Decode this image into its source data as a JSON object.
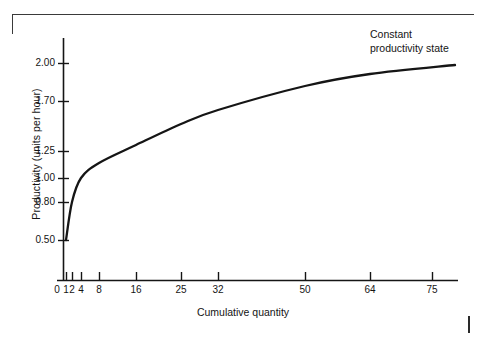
{
  "figure": {
    "annotation": "Constant\nproductivity state",
    "annotation_x": 370,
    "annotation_y": 28
  },
  "chart_data": {
    "type": "line",
    "title": "",
    "subtitle": "",
    "xlabel": "Cumulative quantity",
    "ylabel": "Productivity (units per hour)",
    "grid": false,
    "legend": null,
    "annotations": [
      {
        "text": "Constant productivity state",
        "x": 75,
        "y": 2.0,
        "position": "top-right"
      }
    ],
    "x_axis": {
      "label": "Cumulative quantity",
      "scale": "compressed-nonlinear",
      "tick_values": [
        0,
        1,
        2,
        4,
        8,
        16,
        25,
        32,
        50,
        64,
        75
      ],
      "tick_labels": [
        "0",
        "1",
        "2",
        "4",
        "8",
        "16",
        "25",
        "32",
        "50",
        "64",
        "75"
      ],
      "tick_px": [
        57,
        66,
        72,
        81,
        99,
        136,
        181,
        218,
        305,
        370,
        432
      ],
      "range": [
        0,
        75
      ]
    },
    "y_axis": {
      "label": "Productivity (units per hour)",
      "tick_values": [
        0.5,
        0.8,
        1.0,
        1.25,
        1.7,
        2.0
      ],
      "tick_labels": [
        "0.50",
        "0.80",
        "1.00",
        "1.25",
        "1.70",
        "2.00"
      ],
      "tick_px": [
        240,
        202,
        178,
        151,
        101,
        63
      ],
      "range": [
        0.0,
        2.0
      ]
    },
    "series": [
      {
        "name": "Productivity learning curve",
        "color": "#151515",
        "x": [
          1,
          2,
          4,
          8,
          16,
          25,
          32,
          50,
          64,
          75
        ],
        "y": [
          0.5,
          0.8,
          1.0,
          1.15,
          1.33,
          1.52,
          1.64,
          1.83,
          1.92,
          1.98
        ],
        "points_px": [
          [
            66,
            240
          ],
          [
            72,
            202
          ],
          [
            81,
            178
          ],
          [
            99,
            163
          ],
          [
            136,
            145
          ],
          [
            181,
            124
          ],
          [
            218,
            110
          ],
          [
            305,
            86
          ],
          [
            370,
            74
          ],
          [
            455,
            65
          ]
        ]
      }
    ]
  }
}
